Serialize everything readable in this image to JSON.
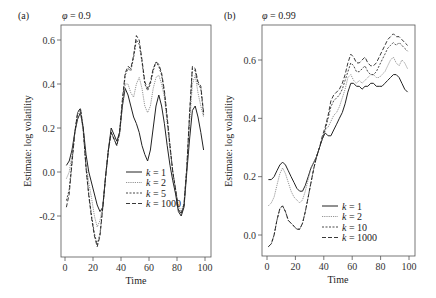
{
  "chart_data": [
    {
      "type": "line",
      "panel_label": "(a)",
      "title": "φ = 0.9",
      "phi_symbol": "φ",
      "phi_value": "0.9",
      "xlabel": "Time",
      "ylabel": "Estimate: log volatility",
      "xlim": [
        -2,
        102
      ],
      "ylim": [
        -0.37,
        0.68
      ],
      "xticks": [
        0,
        20,
        40,
        60,
        80,
        100
      ],
      "yticks": [
        -0.2,
        0.0,
        0.2,
        0.4,
        0.6
      ],
      "ytick_labels": [
        "-0.2",
        "0.0",
        "0.2",
        "0.4",
        "0.6"
      ],
      "grid": false,
      "legend_position": "lower center",
      "x": [
        1,
        3,
        5,
        7,
        9,
        11,
        13,
        15,
        17,
        19,
        21,
        23,
        25,
        27,
        29,
        31,
        33,
        35,
        37,
        39,
        41,
        43,
        45,
        47,
        49,
        51,
        53,
        55,
        57,
        59,
        61,
        63,
        65,
        67,
        69,
        71,
        73,
        75,
        77,
        79,
        81,
        83,
        85,
        87,
        89,
        91,
        93,
        95,
        97,
        99
      ],
      "series": [
        {
          "name": "k = 1",
          "legend_k": "1",
          "style": "solid",
          "values": [
            0.03,
            0.05,
            0.1,
            0.18,
            0.24,
            0.27,
            0.2,
            0.08,
            0.0,
            -0.05,
            -0.1,
            -0.15,
            -0.18,
            -0.16,
            -0.02,
            0.1,
            0.2,
            0.17,
            0.14,
            0.18,
            0.3,
            0.38,
            0.35,
            0.3,
            0.25,
            0.22,
            0.18,
            0.12,
            0.08,
            0.05,
            0.1,
            0.2,
            0.3,
            0.35,
            0.3,
            0.22,
            0.12,
            0.03,
            -0.04,
            -0.1,
            -0.18,
            -0.2,
            -0.16,
            0.0,
            0.15,
            0.28,
            0.3,
            0.25,
            0.18,
            0.1
          ]
        },
        {
          "name": "k = 2",
          "legend_k": "2",
          "style": "dotted-light",
          "values": [
            -0.03,
            0.0,
            0.08,
            0.18,
            0.26,
            0.28,
            0.18,
            0.04,
            -0.05,
            -0.12,
            -0.2,
            -0.25,
            -0.22,
            -0.15,
            -0.02,
            0.1,
            0.18,
            0.15,
            0.12,
            0.17,
            0.3,
            0.4,
            0.4,
            0.36,
            0.34,
            0.4,
            0.43,
            0.38,
            0.3,
            0.27,
            0.3,
            0.38,
            0.43,
            0.44,
            0.4,
            0.34,
            0.22,
            0.1,
            0.0,
            -0.08,
            -0.15,
            -0.18,
            -0.14,
            0.02,
            0.22,
            0.4,
            0.44,
            0.36,
            0.3,
            0.25
          ]
        },
        {
          "name": "k = 5",
          "legend_k": "5",
          "style": "short-dash",
          "values": [
            -0.13,
            -0.08,
            0.05,
            0.18,
            0.27,
            0.29,
            0.2,
            0.02,
            -0.1,
            -0.2,
            -0.28,
            -0.33,
            -0.28,
            -0.16,
            -0.02,
            0.1,
            0.18,
            0.15,
            0.12,
            0.18,
            0.32,
            0.44,
            0.47,
            0.46,
            0.52,
            0.6,
            0.58,
            0.5,
            0.4,
            0.37,
            0.4,
            0.46,
            0.5,
            0.48,
            0.44,
            0.36,
            0.24,
            0.12,
            0.0,
            -0.08,
            -0.17,
            -0.19,
            -0.15,
            0.02,
            0.26,
            0.47,
            0.46,
            0.4,
            0.38,
            0.26
          ]
        },
        {
          "name": "k = 1000",
          "legend_k": "1000",
          "style": "long-dash",
          "values": [
            -0.16,
            -0.1,
            0.04,
            0.18,
            0.27,
            0.29,
            0.2,
            0.02,
            -0.11,
            -0.21,
            -0.29,
            -0.34,
            -0.29,
            -0.16,
            -0.02,
            0.1,
            0.18,
            0.15,
            0.12,
            0.18,
            0.33,
            0.45,
            0.48,
            0.47,
            0.53,
            0.62,
            0.6,
            0.51,
            0.41,
            0.38,
            0.41,
            0.47,
            0.5,
            0.49,
            0.45,
            0.37,
            0.25,
            0.12,
            0.0,
            -0.08,
            -0.17,
            -0.19,
            -0.15,
            0.02,
            0.27,
            0.48,
            0.47,
            0.41,
            0.39,
            0.27
          ]
        }
      ]
    },
    {
      "type": "line",
      "panel_label": "(b)",
      "title": "φ = 0.99",
      "phi_symbol": "φ",
      "phi_value": "0.99",
      "xlabel": "Time",
      "ylabel": "Estimate: log volatility",
      "xlim": [
        -2,
        102
      ],
      "ylim": [
        -0.07,
        0.72
      ],
      "xticks": [
        0,
        20,
        40,
        60,
        80,
        100
      ],
      "yticks": [
        0.0,
        0.2,
        0.4,
        0.6
      ],
      "ytick_labels": [
        "0.0",
        "0.2",
        "0.4",
        "0.6"
      ],
      "grid": false,
      "legend_position": "lower right",
      "x": [
        1,
        3,
        5,
        7,
        9,
        11,
        13,
        15,
        17,
        19,
        21,
        23,
        25,
        27,
        29,
        31,
        33,
        35,
        37,
        39,
        41,
        43,
        45,
        47,
        49,
        51,
        53,
        55,
        57,
        59,
        61,
        63,
        65,
        67,
        69,
        71,
        73,
        75,
        77,
        79,
        81,
        83,
        85,
        87,
        89,
        91,
        93,
        95,
        97,
        99
      ],
      "series": [
        {
          "name": "k = 1",
          "legend_k": "1",
          "style": "solid",
          "values": [
            0.19,
            0.19,
            0.2,
            0.22,
            0.24,
            0.25,
            0.24,
            0.22,
            0.2,
            0.18,
            0.16,
            0.15,
            0.15,
            0.17,
            0.2,
            0.23,
            0.25,
            0.27,
            0.3,
            0.33,
            0.35,
            0.34,
            0.34,
            0.36,
            0.38,
            0.4,
            0.42,
            0.45,
            0.49,
            0.52,
            0.52,
            0.51,
            0.51,
            0.5,
            0.51,
            0.51,
            0.52,
            0.52,
            0.51,
            0.51,
            0.51,
            0.52,
            0.53,
            0.54,
            0.55,
            0.55,
            0.54,
            0.52,
            0.5,
            0.49
          ]
        },
        {
          "name": "k = 2",
          "legend_k": "2",
          "style": "dotted-light",
          "values": [
            0.1,
            0.11,
            0.13,
            0.17,
            0.21,
            0.23,
            0.21,
            0.18,
            0.15,
            0.13,
            0.12,
            0.11,
            0.12,
            0.15,
            0.19,
            0.23,
            0.25,
            0.27,
            0.3,
            0.33,
            0.36,
            0.37,
            0.39,
            0.41,
            0.42,
            0.44,
            0.47,
            0.5,
            0.54,
            0.55,
            0.53,
            0.52,
            0.53,
            0.52,
            0.53,
            0.54,
            0.55,
            0.55,
            0.54,
            0.54,
            0.55,
            0.56,
            0.58,
            0.6,
            0.61,
            0.59,
            0.58,
            0.6,
            0.59,
            0.57
          ]
        },
        {
          "name": "k = 10",
          "legend_k": "10",
          "style": "short-dash",
          "values": [
            -0.04,
            -0.03,
            0.0,
            0.05,
            0.09,
            0.1,
            0.08,
            0.05,
            0.04,
            0.03,
            0.02,
            0.02,
            0.04,
            0.08,
            0.13,
            0.18,
            0.23,
            0.27,
            0.3,
            0.33,
            0.36,
            0.4,
            0.44,
            0.46,
            0.47,
            0.48,
            0.5,
            0.53,
            0.56,
            0.59,
            0.58,
            0.56,
            0.56,
            0.57,
            0.58,
            0.56,
            0.55,
            0.55,
            0.56,
            0.58,
            0.6,
            0.62,
            0.64,
            0.65,
            0.66,
            0.65,
            0.66,
            0.65,
            0.64,
            0.63
          ]
        },
        {
          "name": "k = 1000",
          "legend_k": "1000",
          "style": "long-dash",
          "values": [
            -0.04,
            -0.03,
            0.0,
            0.05,
            0.09,
            0.1,
            0.08,
            0.05,
            0.04,
            0.03,
            0.02,
            0.02,
            0.04,
            0.08,
            0.13,
            0.18,
            0.23,
            0.27,
            0.3,
            0.34,
            0.37,
            0.41,
            0.46,
            0.48,
            0.49,
            0.5,
            0.52,
            0.55,
            0.59,
            0.62,
            0.61,
            0.59,
            0.59,
            0.6,
            0.61,
            0.59,
            0.58,
            0.58,
            0.59,
            0.61,
            0.63,
            0.65,
            0.67,
            0.68,
            0.69,
            0.68,
            0.68,
            0.67,
            0.66,
            0.65
          ]
        }
      ]
    }
  ],
  "legend_key_symbol": "k"
}
